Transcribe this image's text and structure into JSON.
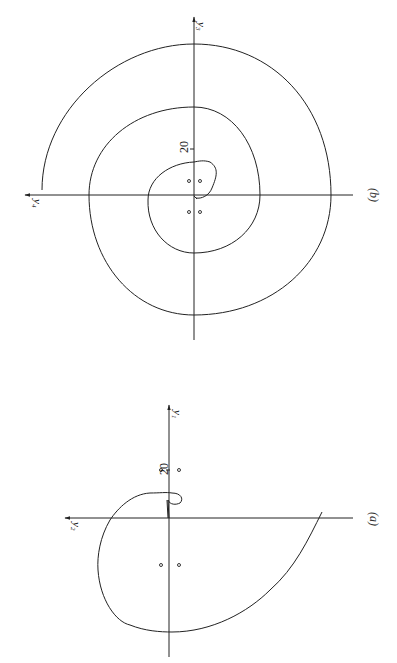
{
  "figure": {
    "orientation": "rotated 90° (landscape figure shown in portrait page)",
    "panels": [
      {
        "id": "b",
        "caption": "(b)",
        "axes": {
          "horizontal_label": "y4",
          "horizontal_sub": "4",
          "vertical_label": "y3",
          "vertical_sub": "3",
          "var": "y"
        },
        "tick_label": "20",
        "equilibrium_points": 4,
        "curve": "outward spiral (trajectory) from near origin, about 2.5 turns"
      },
      {
        "id": "a",
        "caption": "(a)",
        "axes": {
          "horizontal_label": "y2",
          "horizontal_sub": "2",
          "vertical_label": "y1",
          "vertical_sub": "1",
          "var": "y"
        },
        "tick_label": "20",
        "equilibrium_points": 4,
        "curve": "trajectory with small hook near origin, then one large outward arc"
      }
    ]
  },
  "colors": {
    "line": "#222222",
    "background": "#ffffff"
  }
}
